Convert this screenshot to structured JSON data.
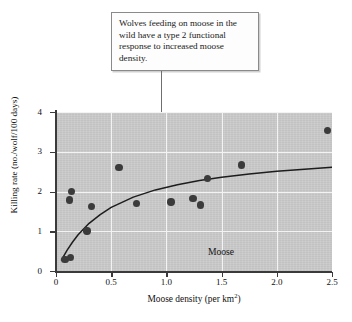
{
  "callout": {
    "text": "Wolves feeding on moose in the wild have a type 2 functional response to increased moose density."
  },
  "chart_data": {
    "type": "scatter",
    "title": "",
    "xlabel": "Moose density (per km",
    "xlabel_sup": "2",
    "xlabel_tail": ")",
    "ylabel": "Killing rate (no./wolf/100 days)",
    "xlim": [
      0,
      2.5
    ],
    "ylim": [
      0,
      4
    ],
    "xticks": [
      "0",
      "0.5",
      "1.0",
      "1.5",
      "2.0",
      "2.5"
    ],
    "xtick_values": [
      0,
      0.5,
      1.0,
      1.5,
      2.0,
      2.5
    ],
    "yticks": [
      "0",
      "1",
      "2",
      "3",
      "4"
    ],
    "ytick_values": [
      0,
      1,
      2,
      3,
      4
    ],
    "grid": true,
    "legend": "none",
    "annotation": "Moose",
    "points": [
      {
        "x": 0.08,
        "y": 0.29
      },
      {
        "x": 0.13,
        "y": 0.34
      },
      {
        "x": 0.12,
        "y": 1.79
      },
      {
        "x": 0.14,
        "y": 2.0
      },
      {
        "x": 0.28,
        "y": 1.01
      },
      {
        "x": 0.32,
        "y": 1.62
      },
      {
        "x": 0.57,
        "y": 2.61
      },
      {
        "x": 0.73,
        "y": 1.7
      },
      {
        "x": 1.04,
        "y": 1.74
      },
      {
        "x": 1.24,
        "y": 1.82
      },
      {
        "x": 1.31,
        "y": 1.66
      },
      {
        "x": 1.37,
        "y": 2.33
      },
      {
        "x": 1.68,
        "y": 2.67
      },
      {
        "x": 2.46,
        "y": 3.53
      }
    ],
    "fit_curve": {
      "model": "type-2-functional-response",
      "description": "Holling type II saturating curve fitted through the scatter",
      "points": [
        {
          "x": 0.05,
          "y": 0.28
        },
        {
          "x": 0.1,
          "y": 0.52
        },
        {
          "x": 0.15,
          "y": 0.73
        },
        {
          "x": 0.2,
          "y": 0.91
        },
        {
          "x": 0.3,
          "y": 1.2
        },
        {
          "x": 0.4,
          "y": 1.42
        },
        {
          "x": 0.5,
          "y": 1.6
        },
        {
          "x": 0.7,
          "y": 1.86
        },
        {
          "x": 0.9,
          "y": 2.04
        },
        {
          "x": 1.1,
          "y": 2.17
        },
        {
          "x": 1.3,
          "y": 2.28
        },
        {
          "x": 1.5,
          "y": 2.36
        },
        {
          "x": 1.75,
          "y": 2.44
        },
        {
          "x": 2.0,
          "y": 2.51
        },
        {
          "x": 2.25,
          "y": 2.56
        },
        {
          "x": 2.5,
          "y": 2.61
        }
      ]
    }
  }
}
